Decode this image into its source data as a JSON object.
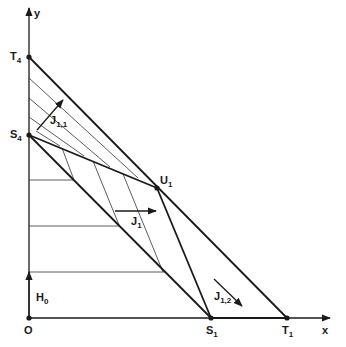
{
  "diagram": {
    "width": 346,
    "height": 347,
    "colors": {
      "ink": "#1a1a1a",
      "thin": "#333333",
      "background": "#ffffff"
    },
    "axes": {
      "origin": {
        "x": 29,
        "y": 318
      },
      "x_axis": {
        "x1": 29,
        "y1": 318,
        "x2": 330,
        "y2": 318,
        "label": "x",
        "label_pos": {
          "x": 322,
          "y": 334
        }
      },
      "y_axis": {
        "x1": 29,
        "y1": 318,
        "x2": 29,
        "y2": 8,
        "label": "y",
        "label_pos": {
          "x": 34,
          "y": 17
        }
      }
    },
    "points": [
      {
        "id": "O",
        "x": 29,
        "y": 318,
        "label": "O",
        "sub": "",
        "label_pos": {
          "x": 24,
          "y": 334
        }
      },
      {
        "id": "T4",
        "x": 29,
        "y": 57,
        "label": "T",
        "sub": "4",
        "label_pos": {
          "x": 10,
          "y": 60
        }
      },
      {
        "id": "S4",
        "x": 29,
        "y": 135,
        "label": "S",
        "sub": "4",
        "label_pos": {
          "x": 10,
          "y": 138
        }
      },
      {
        "id": "U1",
        "x": 157,
        "y": 188,
        "label": "U",
        "sub": "1",
        "label_pos": {
          "x": 160,
          "y": 184
        }
      },
      {
        "id": "S1",
        "x": 211,
        "y": 318,
        "label": "S",
        "sub": "1",
        "label_pos": {
          "x": 206,
          "y": 334
        }
      },
      {
        "id": "T1",
        "x": 287,
        "y": 318,
        "label": "T",
        "sub": "1",
        "label_pos": {
          "x": 282,
          "y": 334
        }
      }
    ],
    "thick_lines": [
      {
        "name": "line-T4-T1",
        "x1": 29,
        "y1": 57,
        "x2": 287,
        "y2": 318
      },
      {
        "name": "line-S4-U1",
        "x1": 29,
        "y1": 135,
        "x2": 157,
        "y2": 188
      },
      {
        "name": "line-S4-S1",
        "x1": 29,
        "y1": 135,
        "x2": 211,
        "y2": 318
      },
      {
        "name": "line-U1-S1",
        "x1": 157,
        "y1": 188,
        "x2": 211,
        "y2": 318
      },
      {
        "name": "line-S1-T1",
        "x1": 211,
        "y1": 318,
        "x2": 287,
        "y2": 318
      }
    ],
    "hatch_diagonal": [
      {
        "x1": 29,
        "y1": 78,
        "x2": 138,
        "y2": 178
      },
      {
        "x1": 29,
        "y1": 98,
        "x2": 110,
        "y2": 167
      },
      {
        "x1": 29,
        "y1": 117,
        "x2": 84,
        "y2": 156
      },
      {
        "x1": 36,
        "y1": 131,
        "x2": 60,
        "y2": 146
      }
    ],
    "hatch_steep": [
      {
        "x1": 62,
        "y1": 148,
        "x2": 74,
        "y2": 180
      },
      {
        "x1": 93,
        "y1": 161,
        "x2": 119,
        "y2": 225
      },
      {
        "x1": 123,
        "y1": 174,
        "x2": 163,
        "y2": 272
      }
    ],
    "hatch_horizontal": [
      {
        "x1": 29,
        "y1": 180,
        "x2": 74,
        "y2": 180
      },
      {
        "x1": 29,
        "y1": 226,
        "x2": 119,
        "y2": 226
      },
      {
        "x1": 29,
        "y1": 272,
        "x2": 165,
        "y2": 272
      }
    ],
    "arrows": [
      {
        "id": "H0",
        "x1": 29,
        "y1": 318,
        "x2": 29,
        "y2": 272,
        "label": "H",
        "sub": "0",
        "label_pos": {
          "x": 36,
          "y": 301
        }
      },
      {
        "id": "J11",
        "x1": 37,
        "y1": 130,
        "x2": 63,
        "y2": 100,
        "label": "J",
        "sub": "1,1",
        "label_pos": {
          "x": 50,
          "y": 124
        }
      },
      {
        "id": "J1",
        "x1": 115,
        "y1": 211,
        "x2": 156,
        "y2": 211,
        "label": "J",
        "sub": "1",
        "label_pos": {
          "x": 131,
          "y": 225
        }
      },
      {
        "id": "J12",
        "x1": 214,
        "y1": 279,
        "x2": 242,
        "y2": 306,
        "label": "J",
        "sub": "1,2",
        "label_pos": {
          "x": 214,
          "y": 300
        }
      }
    ]
  }
}
